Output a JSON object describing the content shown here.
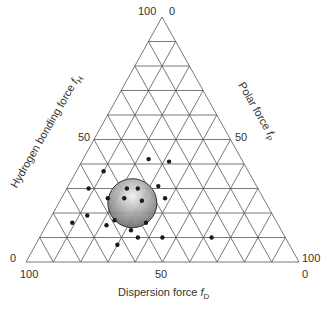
{
  "chart_data": {
    "type": "ternary-scatter",
    "title": "",
    "axes": {
      "bottom": {
        "name": "Dispersion force",
        "symbol": "f",
        "subscript": "D",
        "ticks": [
          "100",
          "50",
          "0"
        ]
      },
      "left": {
        "name": "Hydrogen bonding force",
        "symbol": "f",
        "subscript": "H",
        "ticks": [
          "100",
          "50",
          "0"
        ]
      },
      "right": {
        "name": "Polar force",
        "symbol": "f",
        "subscript": "P",
        "ticks": [
          "0",
          "50",
          "100"
        ]
      }
    },
    "grid": {
      "enabled": true,
      "divisions": 10,
      "interval": 10
    },
    "region": {
      "shape": "circle",
      "fill": "gradient-gray",
      "center": {
        "fD": 49,
        "fP": 27,
        "fH": 24
      },
      "radius_units": 10
    },
    "points": [
      {
        "fD": 53,
        "fP": 10,
        "fH": 37
      },
      {
        "fD": 34,
        "fP": 24,
        "fH": 42
      },
      {
        "fD": 48,
        "fP": 22,
        "fH": 30
      },
      {
        "fD": 27,
        "fP": 32,
        "fH": 41
      },
      {
        "fD": 62,
        "fP": 8,
        "fH": 30
      },
      {
        "fD": 36,
        "fP": 33,
        "fH": 31
      },
      {
        "fD": 36,
        "fP": 38,
        "fH": 26
      },
      {
        "fD": 44,
        "fP": 26,
        "fH": 30
      },
      {
        "fD": 51,
        "fP": 23,
        "fH": 26
      },
      {
        "fD": 45,
        "fP": 30,
        "fH": 25
      },
      {
        "fD": 57,
        "fP": 17,
        "fH": 26
      },
      {
        "fD": 59,
        "fP": 24,
        "fH": 17
      },
      {
        "fD": 63,
        "fP": 22,
        "fH": 15
      },
      {
        "fD": 68,
        "fP": 13,
        "fH": 19
      },
      {
        "fD": 75,
        "fP": 9,
        "fH": 16
      },
      {
        "fD": 55,
        "fP": 32,
        "fH": 13
      },
      {
        "fD": 63,
        "fP": 30,
        "fH": 7
      },
      {
        "fD": 48,
        "fP": 36,
        "fH": 16
      },
      {
        "fD": 54,
        "fP": 36,
        "fH": 10
      },
      {
        "fD": 45,
        "fP": 45,
        "fH": 10
      },
      {
        "fD": 27,
        "fP": 63,
        "fH": 10
      }
    ]
  },
  "labels": {
    "top_left_tick": "100",
    "top_right_tick": "0",
    "left_mid_tick": "50",
    "right_mid_tick": "50",
    "bottom_left_side_tick": "0",
    "bottom_right_side_tick": "100",
    "bottom_left_tick": "100",
    "bottom_mid_tick": "50",
    "bottom_right_tick": "0",
    "dispersion_name": "Dispersion force ",
    "dispersion_sym": "f",
    "dispersion_sub": "D",
    "hydrogen_name": "Hydrogen bonding force ",
    "hydrogen_sym": "f",
    "hydrogen_sub": "H",
    "polar_name": "Polar force ",
    "polar_sym": "f",
    "polar_sub": "P"
  },
  "colors": {
    "grid": "#555555",
    "point": "#1a1a1a",
    "circle_edge": "#333333",
    "circle_fill_light": "#e8e8e8",
    "circle_fill_dark": "#6e6e6e"
  }
}
